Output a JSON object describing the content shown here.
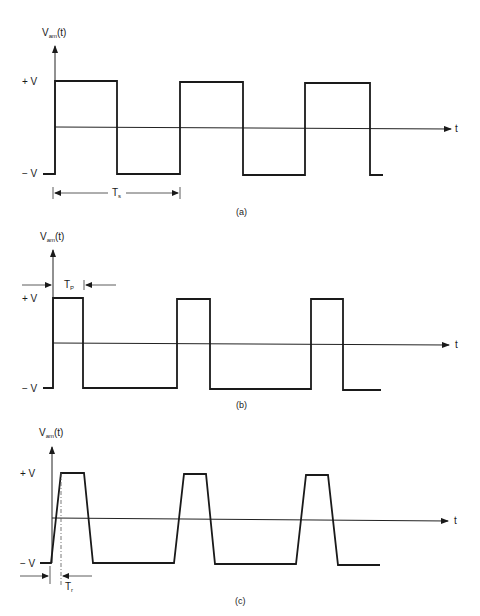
{
  "panels": [
    {
      "id": "a",
      "caption": "(a)",
      "y_axis_label": "V",
      "y_axis_label_sub": "am",
      "y_axis_label_suffix": "(t)",
      "plus_label": "+ V",
      "minus_label": "− V",
      "t_label": "t",
      "dimension_label": "T",
      "dimension_sub": "s",
      "waveform": "square wave, 50% duty cycle"
    },
    {
      "id": "b",
      "caption": "(b)",
      "y_axis_label": "V",
      "y_axis_label_sub": "am",
      "y_axis_label_suffix": "(t)",
      "plus_label": "+ V",
      "minus_label": "− V",
      "t_label": "t",
      "dimension_label": "T",
      "dimension_sub": "P",
      "waveform": "narrow pulse train"
    },
    {
      "id": "c",
      "caption": "(c)",
      "y_axis_label": "V",
      "y_axis_label_sub": "am",
      "y_axis_label_suffix": "(t)",
      "plus_label": "+ V",
      "minus_label": "− V",
      "t_label": "t",
      "dimension_label": "T",
      "dimension_sub": "r",
      "waveform": "trapezoidal pulse train with finite rise time"
    }
  ],
  "colors": {
    "ink": "#1a1a1a",
    "background": "#ffffff"
  }
}
